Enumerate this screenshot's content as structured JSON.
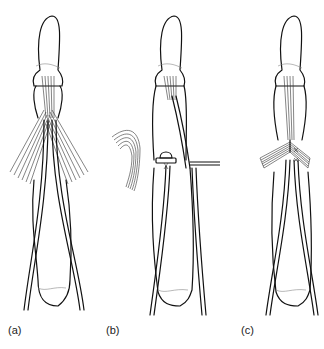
{
  "figure": {
    "panels": [
      {
        "id": "a",
        "label": "(a)",
        "description": "Dorsal view of finger with crossing lateral bands/slips fanning from proximal phalanx"
      },
      {
        "id": "b",
        "label": "(b)",
        "description": "Finger with slip divided and reflected laterally; horizontal probe at PIP level"
      },
      {
        "id": "c",
        "label": "(c)",
        "description": "Finger with slips crossed and sutured over the dorsum"
      }
    ],
    "colors": {
      "line": "#111111",
      "background": "#ffffff"
    }
  }
}
